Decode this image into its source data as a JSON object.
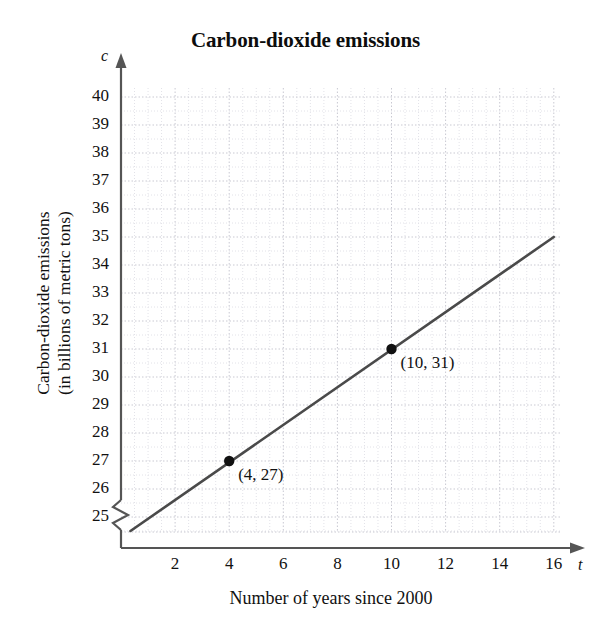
{
  "chart_data": {
    "type": "line",
    "title": "Carbon-dioxide emissions",
    "xlabel": "Number of years since 2000",
    "ylabel": "Carbon-dioxide emissions\n(in billions of metric tons)",
    "x_axis_symbol": "t",
    "y_axis_symbol": "c",
    "xlim": [
      0,
      16.8
    ],
    "ylim": [
      24.2,
      40.5
    ],
    "y_axis_break": true,
    "grid": true,
    "grid_style": "dotted",
    "legend": "none",
    "xticks": [
      2,
      4,
      6,
      8,
      10,
      12,
      14,
      16
    ],
    "xtick_labels": [
      "2",
      "4",
      "6",
      "8",
      "10",
      "12",
      "14",
      "16"
    ],
    "yticks": [
      25,
      26,
      27,
      28,
      29,
      30,
      31,
      32,
      33,
      34,
      35,
      36,
      37,
      38,
      39,
      40
    ],
    "ytick_labels": [
      "25",
      "26",
      "27",
      "28",
      "29",
      "30",
      "31",
      "32",
      "33",
      "34",
      "35",
      "36",
      "37",
      "38",
      "39",
      "40"
    ],
    "series": [
      {
        "name": "Carbon-dioxide emissions",
        "x": [
          0.35,
          16
        ],
        "y": [
          24.5,
          35
        ],
        "slope": 0.6667,
        "intercept": 24.3333,
        "color": "#4a4a4a"
      }
    ],
    "points": [
      {
        "x": 4,
        "y": 27,
        "label": "(4, 27)"
      },
      {
        "x": 10,
        "y": 31,
        "label": "(10, 31)"
      }
    ],
    "colors": {
      "line": "#4a4a4a",
      "axis": "#555555",
      "grid_major": "#c9c9d2",
      "grid_minor": "#e2e2e8",
      "point": "#111111",
      "text": "#111111",
      "background": "#ffffff"
    }
  }
}
